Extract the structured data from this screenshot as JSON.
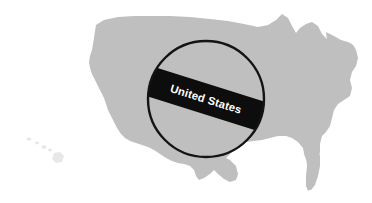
{
  "figure": {
    "type": "map-illustration",
    "background_color": "#ffffff",
    "width": 372,
    "height": 203
  },
  "map": {
    "name": "united-states-silhouette",
    "land_color": "#bfbfbf",
    "island_color": "#e8e8e8",
    "includes_hawaii": true
  },
  "highlight": {
    "shape": "circle",
    "stroke_color": "#141414",
    "stroke_width": 2.4,
    "center_x": 206,
    "center_y": 99,
    "radius": 59
  },
  "callout": {
    "band_color": "#0d0d0d",
    "text_color": "#ffffff",
    "label": "United States",
    "rotation_degrees": 17.5
  }
}
